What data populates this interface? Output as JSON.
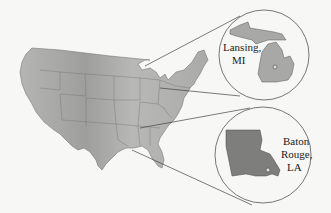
{
  "figure": {
    "background": "#f7f7f5",
    "map_fill": "#a9a9a7",
    "callouts": [
      {
        "id": "michigan",
        "state": "Michigan",
        "label_line1": "Lansing,",
        "label_line2": "MI"
      },
      {
        "id": "louisiana",
        "state": "Louisiana",
        "label_line1": "Baton",
        "label_line2": "Rouge,",
        "label_line3": "LA"
      }
    ]
  }
}
